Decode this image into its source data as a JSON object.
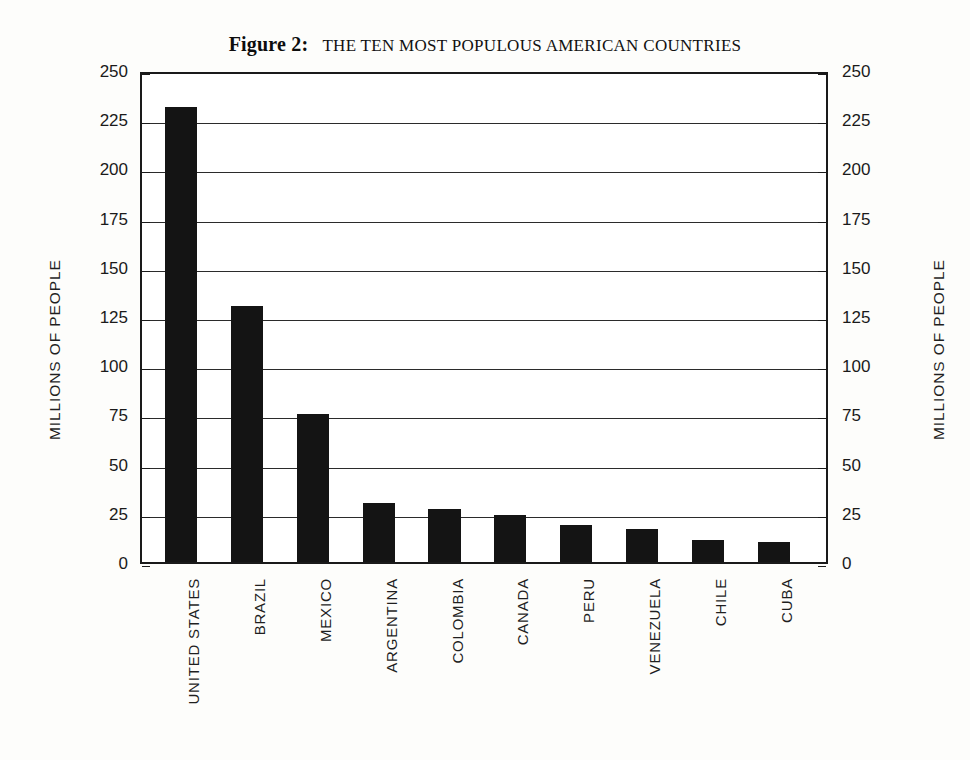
{
  "title": {
    "figure_label": "Figure 2:",
    "text": "THE TEN MOST POPULOUS AMERICAN COUNTRIES"
  },
  "axes": {
    "left_title": "MILLIONS OF PEOPLE",
    "right_title": "MILLIONS OF PEOPLE"
  },
  "chart_data": {
    "type": "bar",
    "xlabel": "",
    "ylabel": "MILLIONS OF PEOPLE",
    "y2label": "MILLIONS OF PEOPLE",
    "ylim": [
      0,
      250
    ],
    "yticks": [
      0,
      25,
      50,
      75,
      100,
      125,
      150,
      175,
      200,
      225,
      250
    ],
    "ytick_labels": [
      "0",
      "25",
      "50",
      "75",
      "100",
      "125",
      "150",
      "175",
      "200",
      "225",
      "250"
    ],
    "grid": true,
    "legend": false,
    "bar_color": "#141414",
    "categories": [
      "UNITED STATES",
      "BRAZIL",
      "MEXICO",
      "ARGENTINA",
      "COLOMBIA",
      "CANADA",
      "PERU",
      "VENEZUELA",
      "CHILE",
      "CUBA"
    ],
    "values": [
      231,
      130,
      75,
      30,
      27,
      24,
      19,
      17,
      11,
      10
    ],
    "units": "millions of people"
  }
}
